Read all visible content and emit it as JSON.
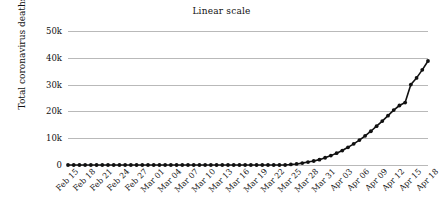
{
  "chart_data": {
    "type": "line",
    "title": "Linear scale",
    "xlabel": "",
    "ylabel": "Total coronavirus deaths",
    "ylim": [
      0,
      50000
    ],
    "ytick_labels": [
      "0",
      "10k",
      "20k",
      "30k",
      "40k",
      "50k"
    ],
    "ytick_values": [
      0,
      10000,
      20000,
      30000,
      40000,
      50000
    ],
    "grid": true,
    "legend": "none",
    "marker": "circle",
    "line_color": "#111111",
    "grid_color": "#b9b9b9",
    "background_color": "#ffffff",
    "xtick_labels": [
      "Feb 15",
      "Feb 18",
      "Feb 21",
      "Feb 24",
      "Feb 27",
      "Mar 01",
      "Mar 04",
      "Mar 07",
      "Mar 10",
      "Mar 13",
      "Mar 16",
      "Mar 19",
      "Mar 22",
      "Mar 25",
      "Mar 28",
      "Mar 31",
      "Apr 03",
      "Apr 06",
      "Apr 09",
      "Apr 12",
      "Apr 15",
      "Apr 18"
    ],
    "x": [
      "Feb 15",
      "Feb 16",
      "Feb 17",
      "Feb 18",
      "Feb 19",
      "Feb 20",
      "Feb 21",
      "Feb 22",
      "Feb 23",
      "Feb 24",
      "Feb 25",
      "Feb 26",
      "Feb 27",
      "Feb 28",
      "Feb 29",
      "Mar 01",
      "Mar 02",
      "Mar 03",
      "Mar 04",
      "Mar 05",
      "Mar 06",
      "Mar 07",
      "Mar 08",
      "Mar 09",
      "Mar 10",
      "Mar 11",
      "Mar 12",
      "Mar 13",
      "Mar 14",
      "Mar 15",
      "Mar 16",
      "Mar 17",
      "Mar 18",
      "Mar 19",
      "Mar 20",
      "Mar 21",
      "Mar 22",
      "Mar 23",
      "Mar 24",
      "Mar 25",
      "Mar 26",
      "Mar 27",
      "Mar 28",
      "Mar 29",
      "Mar 30",
      "Mar 31",
      "Apr 01",
      "Apr 02",
      "Apr 03",
      "Apr 04",
      "Apr 05",
      "Apr 06",
      "Apr 07",
      "Apr 08",
      "Apr 09",
      "Apr 10",
      "Apr 11",
      "Apr 12",
      "Apr 13",
      "Apr 14",
      "Apr 15",
      "Apr 16",
      "Apr 17",
      "Apr 18"
    ],
    "values": [
      0,
      0,
      0,
      0,
      0,
      0,
      0,
      0,
      0,
      0,
      0,
      0,
      0,
      0,
      0,
      0,
      0,
      0,
      0,
      0,
      0,
      0,
      0,
      0,
      0,
      0,
      0,
      0,
      0,
      0,
      0,
      0,
      0,
      0,
      0,
      0,
      0,
      0,
      0,
      200,
      400,
      700,
      1100,
      1500,
      2000,
      2700,
      3500,
      4400,
      5400,
      6600,
      7900,
      9300,
      10900,
      12600,
      14500,
      16400,
      18400,
      20500,
      22200,
      23300,
      30000,
      32500,
      35500,
      38800
    ],
    "series_name": "Total coronavirus deaths"
  }
}
